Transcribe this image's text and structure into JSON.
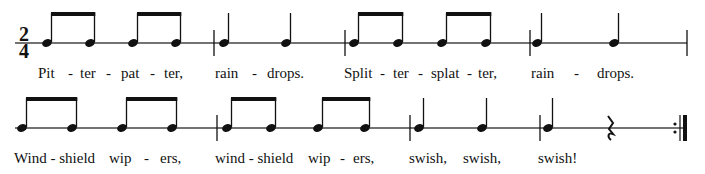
{
  "time_signature": {
    "top": "2",
    "bottom": "4"
  },
  "colors": {
    "ink": "#111111",
    "staff": "#444444"
  },
  "systems": [
    {
      "staff_y": 43,
      "lyrics_y": 66,
      "measures": [
        {
          "notes": [
            {
              "x": 47,
              "type": "eighth",
              "beam": "start"
            },
            {
              "x": 90,
              "type": "eighth",
              "beam": "end"
            },
            {
              "x": 133,
              "type": "eighth",
              "beam": "start"
            },
            {
              "x": 176,
              "type": "eighth",
              "beam": "end"
            }
          ],
          "barline_x": 214
        },
        {
          "notes": [
            {
              "x": 224,
              "type": "quarter"
            },
            {
              "x": 286,
              "type": "quarter"
            }
          ],
          "barline_x": 345
        },
        {
          "notes": [
            {
              "x": 354,
              "type": "eighth",
              "beam": "start"
            },
            {
              "x": 398,
              "type": "eighth",
              "beam": "end"
            },
            {
              "x": 442,
              "type": "eighth",
              "beam": "start"
            },
            {
              "x": 486,
              "type": "eighth",
              "beam": "end"
            }
          ],
          "barline_x": 530
        },
        {
          "notes": [
            {
              "x": 537,
              "type": "quarter"
            },
            {
              "x": 614,
              "type": "quarter"
            }
          ],
          "barline_x": 687
        }
      ],
      "lyrics": [
        {
          "x": 38,
          "text": "Pit"
        },
        {
          "x": 68,
          "text": "-"
        },
        {
          "x": 80,
          "text": "ter"
        },
        {
          "x": 106,
          "text": "-"
        },
        {
          "x": 121,
          "text": "pat"
        },
        {
          "x": 150,
          "text": "-"
        },
        {
          "x": 164,
          "text": "ter,"
        },
        {
          "x": 215,
          "text": "rain"
        },
        {
          "x": 252,
          "text": "-"
        },
        {
          "x": 267,
          "text": "drops."
        },
        {
          "x": 344,
          "text": "Split"
        },
        {
          "x": 380,
          "text": "-"
        },
        {
          "x": 393,
          "text": "ter"
        },
        {
          "x": 418,
          "text": "-"
        },
        {
          "x": 431,
          "text": "splat"
        },
        {
          "x": 467,
          "text": "-"
        },
        {
          "x": 478,
          "text": "ter,"
        },
        {
          "x": 531,
          "text": "rain"
        },
        {
          "x": 574,
          "text": "-"
        },
        {
          "x": 597,
          "text": "drops."
        }
      ]
    },
    {
      "staff_y": 128,
      "lyrics_y": 151,
      "measures": [
        {
          "notes": [
            {
              "x": 22,
              "type": "eighth",
              "beam": "start"
            },
            {
              "x": 72,
              "type": "eighth",
              "beam": "end"
            },
            {
              "x": 122,
              "type": "eighth",
              "beam": "start"
            },
            {
              "x": 172,
              "type": "eighth",
              "beam": "end"
            }
          ],
          "barline_x": 217
        },
        {
          "notes": [
            {
              "x": 227,
              "type": "eighth",
              "beam": "start"
            },
            {
              "x": 271,
              "type": "eighth",
              "beam": "end"
            },
            {
              "x": 318,
              "type": "eighth",
              "beam": "start"
            },
            {
              "x": 365,
              "type": "eighth",
              "beam": "end"
            }
          ],
          "barline_x": 410
        },
        {
          "notes": [
            {
              "x": 419,
              "type": "quarter"
            },
            {
              "x": 482,
              "type": "quarter"
            }
          ],
          "barline_x": 540
        },
        {
          "notes": [
            {
              "x": 548,
              "type": "quarter"
            },
            {
              "x": 610,
              "type": "rest"
            }
          ],
          "barline_x": 683,
          "end_repeat": true
        }
      ],
      "lyrics": [
        {
          "x": 14,
          "text": "Wind - shield"
        },
        {
          "x": 109,
          "text": "wip"
        },
        {
          "x": 144,
          "text": "-"
        },
        {
          "x": 160,
          "text": "ers,"
        },
        {
          "x": 215,
          "text": "wind - shield"
        },
        {
          "x": 308,
          "text": "wip"
        },
        {
          "x": 340,
          "text": "-"
        },
        {
          "x": 353,
          "text": "ers,"
        },
        {
          "x": 409,
          "text": "swish,"
        },
        {
          "x": 463,
          "text": "swish,"
        },
        {
          "x": 538,
          "text": "swish!"
        }
      ]
    }
  ]
}
